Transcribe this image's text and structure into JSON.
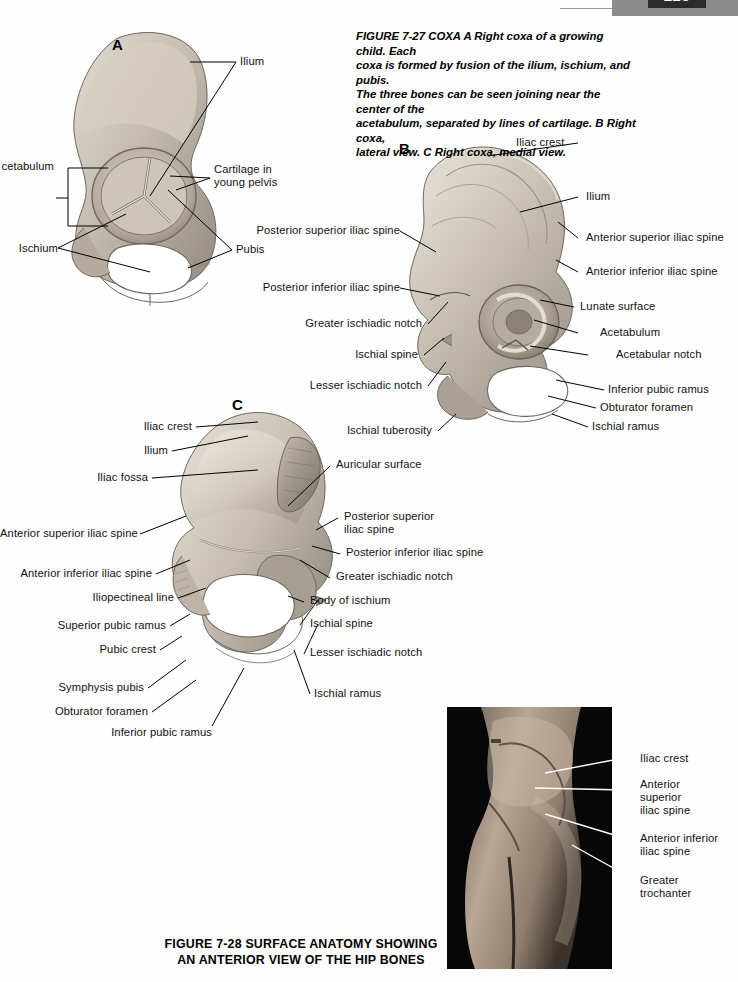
{
  "page": {
    "number": "225",
    "background_color": "#fefefe",
    "header_band_color": "#8b8b8b"
  },
  "figure_27": {
    "caption_prefix": "FIGURE 7-27 COXA",
    "caption_text": " A Right coxa of a growing child. Each coxa is formed by fusion of the ilium, ischium, and pubis. The three bones can be seen joining near the center of the acetabulum, separated by lines of cartilage. B Right coxa, lateral view. C Right coxa, medial view.",
    "caption_lines": [
      "FIGURE 7-27 COXA A Right coxa of a growing child. Each",
      "coxa is formed by fusion of the ilium, ischium, and pubis.",
      "The three bones can be seen joining near the center of the",
      "acetabulum, separated by lines of cartilage. B Right coxa,",
      "lateral view. C Right coxa, medial view."
    ],
    "panels": {
      "a": {
        "letter": "A",
        "title": "Right coxa of a growing child",
        "labels": [
          {
            "text": "Ilium",
            "side": "right"
          },
          {
            "text": "Cartilage in\nyoung pelvis",
            "side": "right"
          },
          {
            "text": "Pubis",
            "side": "right"
          },
          {
            "text": "cetabulum",
            "side": "left",
            "note": "Acetabulum, clipped at page edge"
          },
          {
            "text": "Ischium",
            "side": "left"
          }
        ]
      },
      "b": {
        "letter": "B",
        "title": "Right coxa, lateral view",
        "labels_left": [
          "Posterior superior iliac spine",
          "Posterior inferior iliac spine",
          "Greater ischiadic notch",
          "Ischial spine",
          "Lesser ischiadic notch",
          "Ischial tuberosity"
        ],
        "labels_right": [
          "Iliac crest",
          "Ilium",
          "Anterior superior iliac spine",
          "Anterior inferior iliac spine",
          "Lunate surface",
          "Acetabulum",
          "Acetabular notch",
          "Inferior pubic ramus",
          "Obturator foramen",
          "Ischial ramus"
        ]
      },
      "c": {
        "letter": "C",
        "title": "Right coxa, medial view",
        "labels_left": [
          "Iliac crest",
          "Ilium",
          "Iliac fossa",
          "Anterior superior iliac spine",
          "Anterior inferior iliac spine",
          "Iliopectineal line",
          "Superior pubic ramus",
          "Pubic crest",
          "Symphysis pubis",
          "Obturator foramen",
          "Inferior pubic ramus"
        ],
        "labels_right": [
          "Auricular surface",
          "Posterior superior\niliac spine",
          "Posterior inferior iliac spine",
          "Greater ischiadic notch",
          "Body of ischium",
          "Ischial spine",
          "Lesser ischiadic notch",
          "Ischial ramus"
        ]
      }
    }
  },
  "figure_28": {
    "caption_lines": [
      "FIGURE 7-28 SURFACE ANATOMY SHOWING",
      "AN ANTERIOR VIEW OF THE HIP BONES"
    ],
    "photo_alt": "surface-anatomy-hip-photograph",
    "labels": [
      "Iliac crest",
      "Anterior\nsuperior\niliac spine",
      "Anterior inferior\niliac spine",
      "Greater\ntrochanter"
    ]
  },
  "colors": {
    "bone_light": "#dcd5c8",
    "bone_mid": "#b9b0a2",
    "bone_dark": "#8e857a",
    "bone_shadow": "#6d6760",
    "photo_background": "#050505",
    "leader_line": "#000000",
    "photo_leader_line": "#ffffff"
  }
}
